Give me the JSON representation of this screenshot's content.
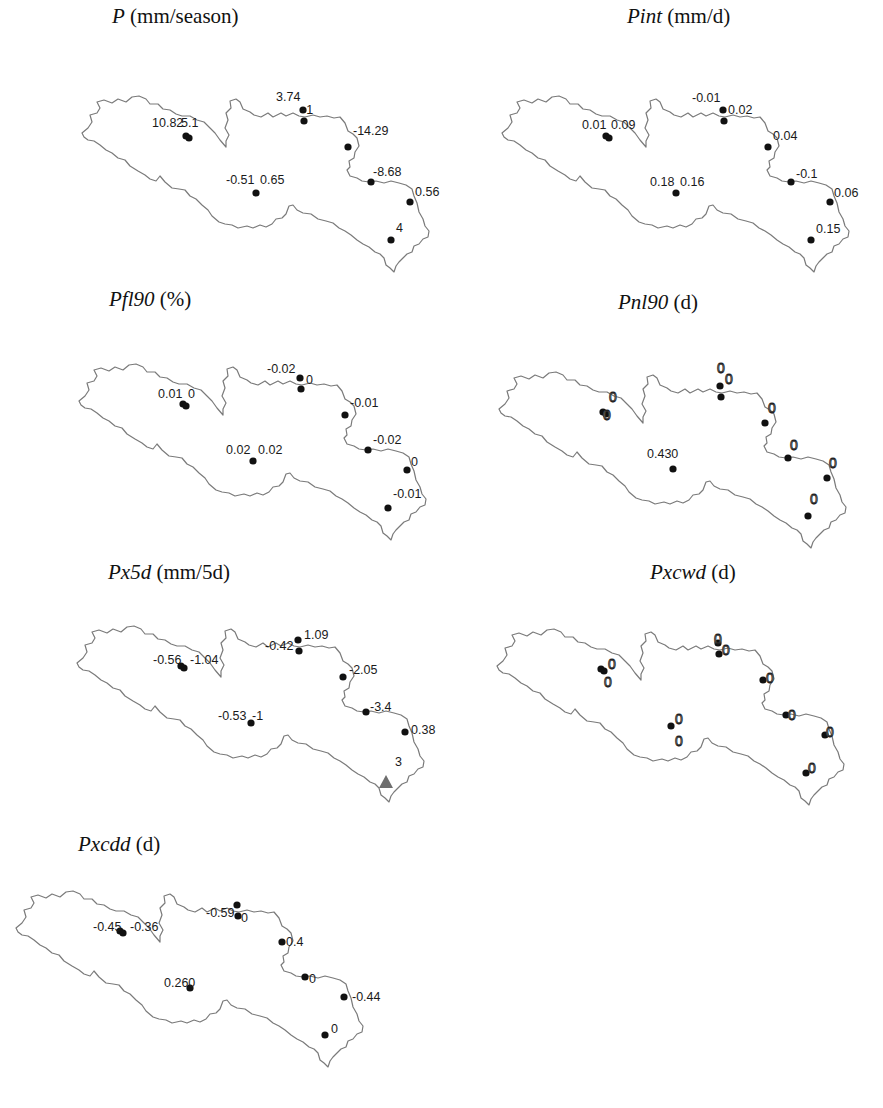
{
  "figure": {
    "panels": [
      {
        "id": "P",
        "title_var": "P",
        "title_unit": " (mm/season)",
        "title_pos": [
          112,
          4
        ],
        "offset": [
          0,
          0
        ],
        "labels": [
          {
            "text": "10.82",
            "x": 152,
            "y": 127
          },
          {
            "text": "5.1",
            "x": 181,
            "y": 127
          },
          {
            "text": "3.74",
            "x": 276,
            "y": 101
          },
          {
            "text": "-1",
            "x": 302,
            "y": 114
          },
          {
            "text": "-14.29",
            "x": 353,
            "y": 135
          },
          {
            "text": "-8.68",
            "x": 373,
            "y": 176
          },
          {
            "text": "0.56",
            "x": 415,
            "y": 196
          },
          {
            "text": "4",
            "x": 396,
            "y": 232
          },
          {
            "text": "-0.51",
            "x": 226,
            "y": 184
          },
          {
            "text": "0.65",
            "x": 260,
            "y": 184
          }
        ]
      },
      {
        "id": "Pint",
        "title_var": "Pint",
        "title_unit": " (mm/d)",
        "title_pos": [
          627,
          4
        ],
        "offset": [
          420,
          0
        ],
        "labels": [
          {
            "text": "0.01",
            "x": 582,
            "y": 129
          },
          {
            "text": "0.09",
            "x": 611,
            "y": 129
          },
          {
            "text": "-0.01",
            "x": 692,
            "y": 102
          },
          {
            "text": "0.02",
            "x": 728,
            "y": 114
          },
          {
            "text": "0.04",
            "x": 773,
            "y": 140
          },
          {
            "text": "-0.1",
            "x": 796,
            "y": 178
          },
          {
            "text": "0.06",
            "x": 834,
            "y": 197
          },
          {
            "text": "0.15",
            "x": 816,
            "y": 233
          },
          {
            "text": "0.18",
            "x": 650,
            "y": 186
          },
          {
            "text": "0.16",
            "x": 680,
            "y": 186
          }
        ]
      },
      {
        "id": "Pfl90",
        "title_var": "Pfl90",
        "title_unit": " (%)",
        "title_pos": [
          109,
          287
        ],
        "offset": [
          -3,
          268
        ],
        "labels": [
          {
            "text": "0.01",
            "x": 158,
            "y": 398
          },
          {
            "text": "0",
            "x": 188,
            "y": 398
          },
          {
            "text": "-0.02",
            "x": 267,
            "y": 373
          },
          {
            "text": "0",
            "x": 306,
            "y": 384
          },
          {
            "text": "-0.01",
            "x": 350,
            "y": 407
          },
          {
            "text": "-0.02",
            "x": 373,
            "y": 444
          },
          {
            "text": "0",
            "x": 411,
            "y": 466
          },
          {
            "text": "-0.01",
            "x": 393,
            "y": 498
          },
          {
            "text": "0.02",
            "x": 226,
            "y": 454
          },
          {
            "text": "0.02",
            "x": 258,
            "y": 454
          }
        ]
      },
      {
        "id": "Pnl90",
        "title_var": "Pnl90",
        "title_unit": " (d)",
        "title_pos": [
          618,
          290
        ],
        "offset": [
          417,
          276
        ],
        "zero_style": true,
        "labels": [
          {
            "text": "0",
            "x": 609,
            "y": 402
          },
          {
            "text": "0",
            "x": 603,
            "y": 420
          },
          {
            "text": "0",
            "x": 717,
            "y": 373
          },
          {
            "text": "0",
            "x": 725,
            "y": 384
          },
          {
            "text": "0",
            "x": 768,
            "y": 413
          },
          {
            "text": "0",
            "x": 790,
            "y": 450
          },
          {
            "text": "0",
            "x": 829,
            "y": 468
          },
          {
            "text": "0",
            "x": 810,
            "y": 504
          },
          {
            "text": "0.430",
            "x": 647,
            "y": 458,
            "plain": true
          }
        ]
      },
      {
        "id": "Px5d",
        "title_var": "Px5d",
        "title_unit": " (mm/5d)",
        "title_pos": [
          108,
          560
        ],
        "offset": [
          -5,
          530
        ],
        "labels": [
          {
            "text": "-0.56",
            "x": 153,
            "y": 664
          },
          {
            "text": "-1.04",
            "x": 190,
            "y": 664
          },
          {
            "text": "-0.42",
            "x": 265,
            "y": 650
          },
          {
            "text": "1.09",
            "x": 304,
            "y": 639
          },
          {
            "text": "-2.05",
            "x": 349,
            "y": 674
          },
          {
            "text": "-3.4",
            "x": 370,
            "y": 711
          },
          {
            "text": "0.38",
            "x": 411,
            "y": 734
          },
          {
            "text": "3",
            "x": 395,
            "y": 766
          },
          {
            "text": "-0.53",
            "x": 218,
            "y": 720
          },
          {
            "text": "-1",
            "x": 252,
            "y": 720
          }
        ],
        "triangle": {
          "x": 386,
          "y": 782,
          "value": "3"
        }
      },
      {
        "id": "Pxcwd",
        "title_var": "Pxcwd",
        "title_unit": " (d)",
        "title_pos": [
          650,
          560
        ],
        "offset": [
          415,
          533
        ],
        "zero_style": true,
        "labels": [
          {
            "text": "0",
            "x": 608,
            "y": 669
          },
          {
            "text": "0",
            "x": 604,
            "y": 687
          },
          {
            "text": "0",
            "x": 714,
            "y": 644
          },
          {
            "text": "0",
            "x": 722,
            "y": 655
          },
          {
            "text": "0",
            "x": 766,
            "y": 683
          },
          {
            "text": "0",
            "x": 788,
            "y": 720
          },
          {
            "text": "0",
            "x": 826,
            "y": 737
          },
          {
            "text": "0",
            "x": 808,
            "y": 773
          },
          {
            "text": "0",
            "x": 675,
            "y": 724
          },
          {
            "text": "0",
            "x": 675,
            "y": 746
          }
        ]
      },
      {
        "id": "Pxcdd",
        "title_var": "Pxcdd",
        "title_unit": " (d)",
        "title_pos": [
          78,
          832
        ],
        "offset": [
          -66,
          795
        ],
        "labels": [
          {
            "text": "-0.45",
            "x": 93,
            "y": 931
          },
          {
            "text": "-0.36",
            "x": 130,
            "y": 931
          },
          {
            "text": "-0.59",
            "x": 206,
            "y": 917
          },
          {
            "text": "0",
            "x": 241,
            "y": 922
          },
          {
            "text": "0.4",
            "x": 286,
            "y": 946
          },
          {
            "text": "0",
            "x": 309,
            "y": 983
          },
          {
            "text": "-0.44",
            "x": 352,
            "y": 1001
          },
          {
            "text": "0",
            "x": 331,
            "y": 1033
          },
          {
            "text": "0.260",
            "x": 164,
            "y": 987
          }
        ]
      }
    ],
    "station_dots_base": [
      [
        186,
        136
      ],
      [
        189,
        138
      ],
      [
        303,
        110
      ],
      [
        304,
        121
      ],
      [
        348,
        147
      ],
      [
        371,
        182
      ],
      [
        410,
        202
      ],
      [
        391,
        240
      ],
      [
        256,
        193
      ]
    ]
  },
  "chart_data": {
    "type": "scatter",
    "subplots": [
      {
        "index": "P",
        "unit": "mm/season",
        "values": [
          "10.82",
          "5.1",
          "3.74",
          "-1",
          "-14.29",
          "-8.68",
          "0.56",
          "4",
          "-0.51",
          "0.65"
        ]
      },
      {
        "index": "Pint",
        "unit": "mm/d",
        "values": [
          "0.01",
          "0.09",
          "-0.01",
          "0.02",
          "0.04",
          "-0.1",
          "0.06",
          "0.15",
          "0.18",
          "0.16"
        ]
      },
      {
        "index": "Pfl90",
        "unit": "%",
        "values": [
          "0.01",
          "0",
          "-0.02",
          "0",
          "-0.01",
          "-0.02",
          "0",
          "-0.01",
          "0.02",
          "0.02"
        ]
      },
      {
        "index": "Pnl90",
        "unit": "d",
        "values": [
          "0",
          "0",
          "0",
          "0",
          "0",
          "0",
          "0",
          "0",
          "0.43",
          "0"
        ]
      },
      {
        "index": "Px5d",
        "unit": "mm/5d",
        "values": [
          "-0.56",
          "-1.04",
          "-0.42",
          "1.09",
          "-2.05",
          "-3.4",
          "0.38",
          "3",
          "-0.53",
          "-1"
        ],
        "significant_marker": {
          "value": "3",
          "shape": "triangle"
        }
      },
      {
        "index": "Pxcwd",
        "unit": "d",
        "values": [
          "0",
          "0",
          "0",
          "0",
          "0",
          "0",
          "0",
          "0",
          "0",
          "0"
        ]
      },
      {
        "index": "Pxcdd",
        "unit": "d",
        "values": [
          "-0.45",
          "-0.36",
          "-0.59",
          "0",
          "0.4",
          "0",
          "-0.44",
          "0",
          "0.26",
          "0"
        ]
      }
    ],
    "layout": {
      "grid": false,
      "legend": "none",
      "columns": 2
    }
  }
}
